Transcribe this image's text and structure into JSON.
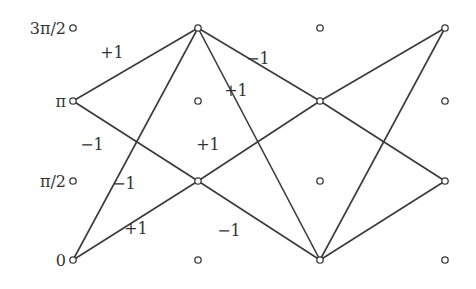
{
  "diagram": {
    "type": "trellis",
    "columns_x": [
      73,
      198,
      320,
      445
    ],
    "rows": [
      {
        "label": "3π/2",
        "y": 28
      },
      {
        "label": "π",
        "y": 101
      },
      {
        "label": "π/2",
        "y": 181
      },
      {
        "label": "0",
        "y": 260
      }
    ],
    "nodes": [
      {
        "col": 0,
        "row": 0
      },
      {
        "col": 0,
        "row": 1
      },
      {
        "col": 0,
        "row": 2
      },
      {
        "col": 0,
        "row": 3
      },
      {
        "col": 1,
        "row": 0
      },
      {
        "col": 1,
        "row": 1
      },
      {
        "col": 1,
        "row": 2
      },
      {
        "col": 1,
        "row": 3
      },
      {
        "col": 2,
        "row": 0
      },
      {
        "col": 2,
        "row": 1
      },
      {
        "col": 2,
        "row": 2
      },
      {
        "col": 2,
        "row": 3
      },
      {
        "col": 3,
        "row": 0
      },
      {
        "col": 3,
        "row": 1
      },
      {
        "col": 3,
        "row": 2
      },
      {
        "col": 3,
        "row": 3
      }
    ],
    "edges": [
      {
        "from": [
          0,
          1
        ],
        "to": [
          1,
          0
        ]
      },
      {
        "from": [
          0,
          1
        ],
        "to": [
          1,
          2
        ]
      },
      {
        "from": [
          0,
          3
        ],
        "to": [
          1,
          0
        ]
      },
      {
        "from": [
          0,
          3
        ],
        "to": [
          1,
          2
        ]
      },
      {
        "from": [
          1,
          0
        ],
        "to": [
          2,
          1
        ]
      },
      {
        "from": [
          1,
          0
        ],
        "to": [
          2,
          3
        ]
      },
      {
        "from": [
          1,
          2
        ],
        "to": [
          2,
          1
        ]
      },
      {
        "from": [
          1,
          2
        ],
        "to": [
          2,
          3
        ]
      },
      {
        "from": [
          2,
          1
        ],
        "to": [
          3,
          0
        ]
      },
      {
        "from": [
          2,
          1
        ],
        "to": [
          3,
          2
        ]
      },
      {
        "from": [
          2,
          3
        ],
        "to": [
          3,
          0
        ]
      },
      {
        "from": [
          2,
          3
        ],
        "to": [
          3,
          2
        ]
      }
    ],
    "edge_labels": [
      {
        "text": "+1",
        "x": 112,
        "y": 58
      },
      {
        "text": "−1",
        "x": 92,
        "y": 150
      },
      {
        "text": "−1",
        "x": 124,
        "y": 189
      },
      {
        "text": "+1",
        "x": 136,
        "y": 234
      },
      {
        "text": "−1",
        "x": 258,
        "y": 64
      },
      {
        "text": "+1",
        "x": 236,
        "y": 96
      },
      {
        "text": "+1",
        "x": 208,
        "y": 150
      },
      {
        "text": "−1",
        "x": 229,
        "y": 236
      }
    ]
  }
}
